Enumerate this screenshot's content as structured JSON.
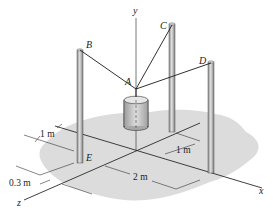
{
  "figure": {
    "type": "statics-3d-cable-support",
    "axes": {
      "x": "x",
      "y": "y",
      "z": "z"
    },
    "points": {
      "A": "A",
      "B": "B",
      "C": "C",
      "D": "D",
      "E": "E"
    },
    "dimensions": {
      "d1": "1 m",
      "d2": "1 m",
      "d3": "2 m",
      "d4": "0.3 m"
    },
    "colors": {
      "shadow": "#d8d8d8",
      "post": "#9a9a9a",
      "post_highlight": "#dcdcdc",
      "cable": "#1a1a1a",
      "axis": "#2a2a2a",
      "cylinder": "#c8c8c8"
    }
  }
}
